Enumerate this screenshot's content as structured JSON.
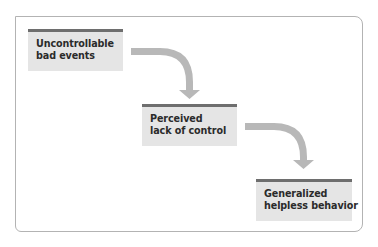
{
  "diagram": {
    "type": "flowchart",
    "direction": "staircase-down-right",
    "colors": {
      "frame_border": "#b3b3b3",
      "box_fill": "#e5e5e5",
      "box_top_bar": "#6e6e6e",
      "arrow": "#b8b8b8",
      "text": "#2b2b2b"
    },
    "nodes": [
      {
        "id": "n1",
        "lines": [
          "Uncontrollable",
          "bad events"
        ]
      },
      {
        "id": "n2",
        "lines": [
          "Perceived",
          "lack of control"
        ]
      },
      {
        "id": "n3",
        "lines": [
          "Generalized",
          "helpless behavior"
        ]
      }
    ],
    "edges": [
      {
        "from": "n1",
        "to": "n2",
        "style": "curved-arrow"
      },
      {
        "from": "n2",
        "to": "n3",
        "style": "curved-arrow"
      }
    ]
  }
}
